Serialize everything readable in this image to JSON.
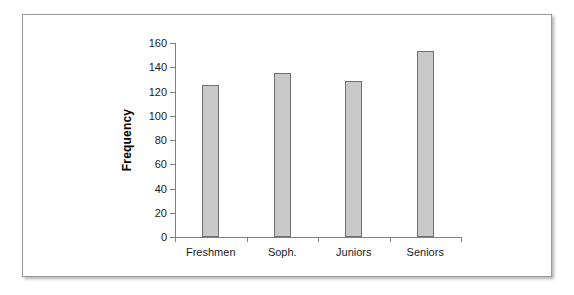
{
  "chart_data": {
    "type": "bar",
    "title": "",
    "xlabel": "",
    "ylabel": "Frequency",
    "categories": [
      "Freshmen",
      "Soph.",
      "Juniors",
      "Seniors"
    ],
    "values": [
      125,
      135,
      129,
      153
    ],
    "ylim": [
      0,
      160
    ],
    "yticks": [
      0,
      20,
      40,
      60,
      80,
      100,
      120,
      140,
      160
    ],
    "ytick_labels": [
      "0",
      "20",
      "40",
      "60",
      "80",
      "100",
      "120",
      "140",
      "160"
    ],
    "grid": false,
    "legend": false,
    "bar_fill_color": "#c9c9c9",
    "bar_border_color": "#6f6f6f",
    "axis_color": "#808080",
    "frame_border_color": "#9a9a9a",
    "background_color": "#ffffff"
  }
}
